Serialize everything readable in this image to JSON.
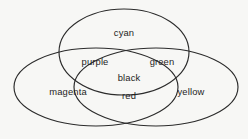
{
  "diagram": {
    "type": "venn",
    "background_color": "#f7f7f5",
    "stroke_color": "#2b2b2b",
    "text_color": "#1e1e1e",
    "sets": [
      {
        "id": "cyan",
        "label": "cyan",
        "position": "top",
        "cx": 124,
        "cy": 52,
        "rx": 65,
        "ry": 43
      },
      {
        "id": "magenta",
        "label": "magenta",
        "position": "bottom-left",
        "cx": 96,
        "cy": 87,
        "rx": 82,
        "ry": 39
      },
      {
        "id": "yellow",
        "label": "yellow",
        "position": "bottom-right",
        "cx": 156,
        "cy": 87,
        "rx": 82,
        "ry": 39
      }
    ],
    "labels": [
      {
        "id": "cyan",
        "text": "cyan",
        "x": 124,
        "y": 34
      },
      {
        "id": "purple",
        "text": "purple",
        "x": 95,
        "y": 63
      },
      {
        "id": "green",
        "text": "green",
        "x": 162,
        "y": 63
      },
      {
        "id": "black",
        "text": "black",
        "x": 129,
        "y": 79
      },
      {
        "id": "magenta",
        "text": "magenta",
        "x": 68,
        "y": 93
      },
      {
        "id": "red",
        "text": "red",
        "x": 129,
        "y": 97
      },
      {
        "id": "yellow",
        "text": "yellow",
        "x": 191,
        "y": 93
      }
    ]
  }
}
